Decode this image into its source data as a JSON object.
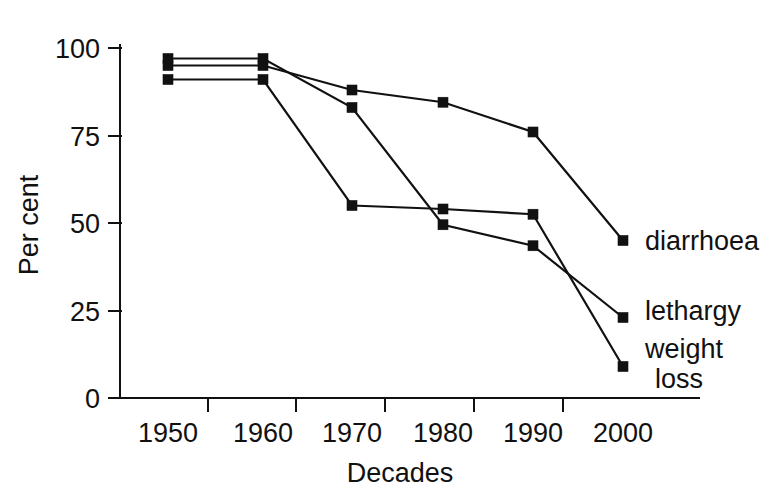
{
  "chart_data": {
    "type": "line",
    "title": "",
    "subtitle": "",
    "xlabel": "Decades",
    "ylabel": "Per cent",
    "categories": [
      "1950",
      "1960",
      "1970",
      "1980",
      "1990",
      "2000"
    ],
    "x": [
      1950,
      1960,
      1970,
      1980,
      1990,
      2000
    ],
    "xlim": [
      1945,
      2005
    ],
    "ylim": [
      0,
      100
    ],
    "y_ticks": [
      0,
      25,
      50,
      75,
      100
    ],
    "y_tick_labels": [
      "0",
      "25",
      "50",
      "75",
      "100"
    ],
    "x_tick_labels": [
      "1950",
      "1960",
      "1970",
      "1980",
      "1990",
      "2000"
    ],
    "grid": false,
    "legend_position": "right-inline-end-of-line",
    "marker": "square",
    "line_color": "#111111",
    "marker_color": "#111111",
    "background_color": "#ffffff",
    "series": [
      {
        "name": "diarrhoea",
        "label": "diarrhoea",
        "values": [
          95,
          95,
          88,
          84.5,
          76,
          45
        ]
      },
      {
        "name": "lethargy",
        "label": "lethargy",
        "values": [
          97,
          97,
          83,
          49.5,
          43.5,
          23
        ]
      },
      {
        "name": "weight loss",
        "label": "weight loss",
        "label_line_1": "weight",
        "label_line_2": "loss",
        "values": [
          91,
          91,
          55,
          54,
          52.5,
          9
        ]
      }
    ]
  },
  "axes": {
    "y_axis_title": "Per cent",
    "x_axis_title": "Decades",
    "y_tick_labels": [
      "100",
      "75",
      "50",
      "25",
      "0"
    ],
    "x_tick_labels": [
      "1950",
      "1960",
      "1970",
      "1980",
      "1990",
      "2000"
    ]
  },
  "labels": {
    "diarrhoea": "diarrhoea",
    "lethargy": "lethargy",
    "weight_loss_line_1": "weight",
    "weight_loss_line_2": "loss"
  }
}
